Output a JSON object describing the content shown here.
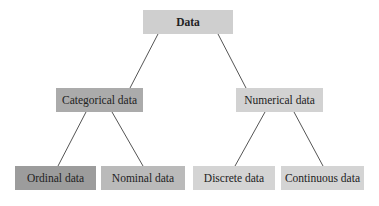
{
  "diagram": {
    "type": "tree",
    "root": {
      "id": "data",
      "label": "Data",
      "color": "#cfcfcf"
    },
    "level1": [
      {
        "id": "categorical",
        "label": "Categorical data",
        "color": "#ababab"
      },
      {
        "id": "numerical",
        "label": "Numerical data",
        "color": "#d2d2d2"
      }
    ],
    "level2": [
      {
        "id": "ordinal",
        "label": "Ordinal data",
        "parent": "categorical",
        "color": "#9c9c9c"
      },
      {
        "id": "nominal",
        "label": "Nominal data",
        "parent": "categorical",
        "color": "#bababa"
      },
      {
        "id": "discrete",
        "label": "Discrete data",
        "parent": "numerical",
        "color": "#d4d4d4"
      },
      {
        "id": "continuous",
        "label": "Continuous data",
        "parent": "numerical",
        "color": "#d4d4d4"
      }
    ],
    "edge_color": "#555555"
  }
}
